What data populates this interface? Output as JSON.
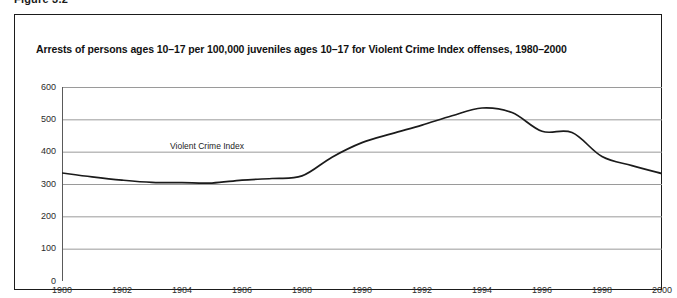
{
  "page": {
    "running_head": "Figure 3.2",
    "background_color": "#ffffff",
    "frame_color": "#1b1b1b"
  },
  "figure": {
    "title": "Arrests of persons ages 10–17 per 100,000 juveniles ages 10–17 for Violent Crime Index offenses, 1980–2000"
  },
  "chart_data": {
    "type": "line",
    "title": "Arrests of persons ages 10–17 per 100,000 juveniles ages 10–17 for Violent Crime Index offenses, 1980–2000",
    "xlabel": "",
    "ylabel": "",
    "xlim": [
      1980,
      2000
    ],
    "ylim": [
      0,
      600
    ],
    "grid": "horizontal",
    "legend_position": "inline-annotation",
    "line_color": "#1b1b1b",
    "gridline_color": "#9a9a9a",
    "axis_color": "#5a5a5a",
    "x_ticks": [
      1980,
      1982,
      1984,
      1986,
      1988,
      1990,
      1992,
      1994,
      1996,
      1998,
      2000
    ],
    "x_tick_labels": [
      "1980",
      "1982",
      "1984",
      "1986",
      "1988",
      "1990",
      "1992",
      "1994",
      "1996",
      "1998",
      "2000"
    ],
    "y_ticks": [
      0,
      100,
      200,
      300,
      400,
      500,
      600
    ],
    "y_tick_labels": [
      "0",
      "100",
      "200",
      "300",
      "400",
      "500",
      "600"
    ],
    "annotations": [
      {
        "text": "Violent Crime Index",
        "x": 1983.6,
        "y": 418
      }
    ],
    "series": [
      {
        "name": "Violent Crime Index",
        "x": [
          1980,
          1981,
          1982,
          1983,
          1984,
          1985,
          1986,
          1987,
          1988,
          1989,
          1990,
          1991,
          1992,
          1993,
          1994,
          1995,
          1996,
          1997,
          1998,
          1999,
          2000
        ],
        "values": [
          334,
          322,
          312,
          305,
          304,
          303,
          312,
          317,
          325,
          383,
          428,
          456,
          482,
          511,
          535,
          521,
          463,
          459,
          385,
          357,
          332
        ]
      }
    ]
  },
  "x_axis": {
    "ticks": [
      {
        "label": "1980",
        "value": 1980
      },
      {
        "label": "1982",
        "value": 1982
      },
      {
        "label": "1984",
        "value": 1984
      },
      {
        "label": "1986",
        "value": 1986
      },
      {
        "label": "1988",
        "value": 1988
      },
      {
        "label": "1990",
        "value": 1990
      },
      {
        "label": "1992",
        "value": 1992
      },
      {
        "label": "1994",
        "value": 1994
      },
      {
        "label": "1996",
        "value": 1996
      },
      {
        "label": "1998",
        "value": 1998
      },
      {
        "label": "2000",
        "value": 2000
      }
    ]
  },
  "y_axis": {
    "ticks": [
      {
        "label": "600",
        "value": 600
      },
      {
        "label": "500",
        "value": 500
      },
      {
        "label": "400",
        "value": 400
      },
      {
        "label": "300",
        "value": 300
      },
      {
        "label": "200",
        "value": 200
      },
      {
        "label": "100",
        "value": 100
      },
      {
        "label": "0",
        "value": 0
      }
    ]
  }
}
